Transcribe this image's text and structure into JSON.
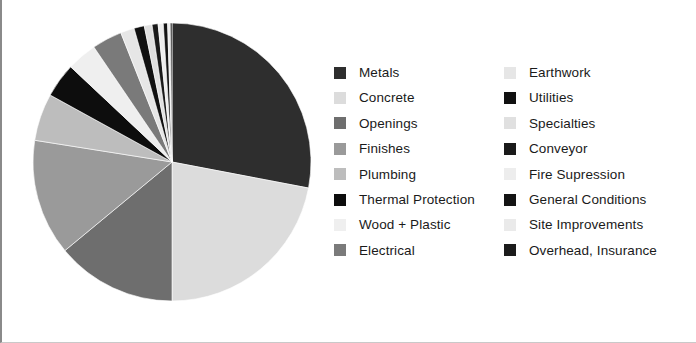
{
  "chart_data": {
    "type": "pie",
    "title": "",
    "subtitle": "",
    "xlabel": "",
    "ylabel": "",
    "grid": false,
    "legend_position": "right",
    "legend_columns": 2,
    "start_angle_deg": -90,
    "direction": "clockwise",
    "categories": [
      "Metals",
      "Concrete",
      "Openings",
      "Finishes",
      "Plumbing",
      "Thermal Protection",
      "Wood + Plastic",
      "Electrical",
      "Earthwork",
      "Utilities",
      "Specialties",
      "Conveyor",
      "Fire Supression",
      "General Conditions",
      "Site Improvements",
      "Overhead, Insurance"
    ],
    "values": [
      28.0,
      22.0,
      14.0,
      13.5,
      5.5,
      4.0,
      3.5,
      3.5,
      1.6,
      1.2,
      0.9,
      0.7,
      0.6,
      0.5,
      0.3,
      0.2
    ],
    "colors": [
      "#2e2e2e",
      "#dcdcdc",
      "#6e6e6e",
      "#9a9a9a",
      "#bdbdbd",
      "#0d0d0d",
      "#efefef",
      "#7a7a7a",
      "#e6e6e6",
      "#111111",
      "#e0e0e0",
      "#1a1a1a",
      "#ededed",
      "#141414",
      "#eaeaea",
      "#1c1c1c"
    ]
  },
  "legend": {
    "columns": [
      {
        "name": "legend-column-left",
        "items": [
          {
            "label": "Metals",
            "color": "#2e2e2e"
          },
          {
            "label": "Concrete",
            "color": "#dcdcdc"
          },
          {
            "label": "Openings",
            "color": "#6e6e6e"
          },
          {
            "label": "Finishes",
            "color": "#9a9a9a"
          },
          {
            "label": "Plumbing",
            "color": "#bdbdbd"
          },
          {
            "label": "Thermal Protection",
            "color": "#0d0d0d"
          },
          {
            "label": "Wood + Plastic",
            "color": "#efefef"
          },
          {
            "label": "Electrical",
            "color": "#7a7a7a"
          }
        ]
      },
      {
        "name": "legend-column-right",
        "items": [
          {
            "label": "Earthwork",
            "color": "#e6e6e6"
          },
          {
            "label": "Utilities",
            "color": "#111111"
          },
          {
            "label": "Specialties",
            "color": "#e0e0e0"
          },
          {
            "label": "Conveyor",
            "color": "#1a1a1a"
          },
          {
            "label": "Fire Supression",
            "color": "#ededed"
          },
          {
            "label": "General Conditions",
            "color": "#141414"
          },
          {
            "label": "Site Improvements",
            "color": "#eaeaea"
          },
          {
            "label": "Overhead, Insurance",
            "color": "#1c1c1c"
          }
        ]
      }
    ]
  }
}
